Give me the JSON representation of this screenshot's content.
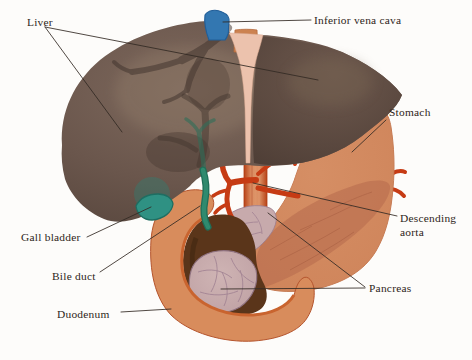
{
  "figure": {
    "type": "anatomical-illustration",
    "background": "#fdfcfa"
  },
  "labels": {
    "liver": "Liver",
    "inferior_vena_cava": "Inferior vena cava",
    "stomach": "Stomach",
    "descending_aorta": {
      "full": "Descending aorta",
      "line1": "Descending",
      "line2": "aorta"
    },
    "pancreas": "Pancreas",
    "gall_bladder": "Gall bladder",
    "bile_duct": "Bile duct",
    "duodenum": "Duodenum"
  },
  "colors": {
    "liver": "#6a564c",
    "liver_left_lobe": "#54433b",
    "falciform_ligament": "#ecc2ad",
    "inferior_vena_cava": "#3377b1",
    "esophagus_stub": "#cc8250",
    "stomach": "#d28a60",
    "pancreas_behind_stomach": "#b76c4e",
    "pancreas_exposed": "#c7aaac",
    "duodenum_wall": "#d88c5c",
    "duodenum_lining": "#c9642f",
    "duodenum_cavity": "#5a351a",
    "gall_bladder": "#2f9183",
    "bile_duct": "#2f8a6e",
    "arteries": "#c63b14",
    "aorta": "#d27a4c",
    "label_text": "#2e2520",
    "leader_line": "#332a24"
  }
}
